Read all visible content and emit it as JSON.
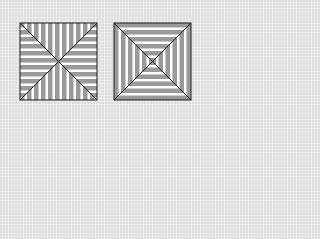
{
  "figure": {
    "colors": {
      "background": "#ececec",
      "stripe_gray": "#9a9a9a",
      "stripe_white": "#ffffff",
      "outline": "#1a1a1a"
    },
    "left_square": {
      "label": "square with diagonals; vertical stripes in top/bottom triangles, horizontal stripes in left/right triangles",
      "x": 20,
      "y": 23,
      "size": 77,
      "stripe_period": 7
    },
    "right_square": {
      "label": "square with diagonals; concentric square stripe rings",
      "x": 114,
      "y": 23,
      "size": 77,
      "ring_period": 7
    }
  }
}
